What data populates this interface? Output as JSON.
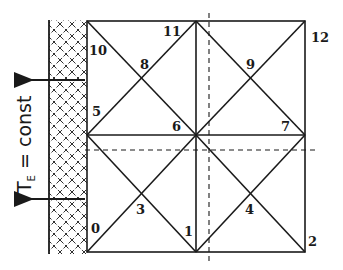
{
  "diagram": {
    "boundary_label": {
      "symbol": "T",
      "subscript": "E",
      "rest": " = const"
    },
    "colors": {
      "line": "#1a1a1a",
      "background": "#ffffff"
    },
    "nodes": [
      {
        "id": "0",
        "label": "0",
        "x": 87,
        "y": 252
      },
      {
        "id": "1",
        "label": "1",
        "x": 196,
        "y": 252
      },
      {
        "id": "2",
        "label": "2",
        "x": 305,
        "y": 252
      },
      {
        "id": "3",
        "label": "3",
        "x": 141,
        "y": 194
      },
      {
        "id": "4",
        "label": "4",
        "x": 250,
        "y": 194
      },
      {
        "id": "5",
        "label": "5",
        "x": 87,
        "y": 135
      },
      {
        "id": "6",
        "label": "6",
        "x": 196,
        "y": 135
      },
      {
        "id": "7",
        "label": "7",
        "x": 305,
        "y": 135
      },
      {
        "id": "8",
        "label": "8",
        "x": 141,
        "y": 78
      },
      {
        "id": "9",
        "label": "9",
        "x": 250,
        "y": 78
      },
      {
        "id": "10",
        "label": "10",
        "x": 87,
        "y": 21
      },
      {
        "id": "11",
        "label": "11",
        "x": 196,
        "y": 21
      },
      {
        "id": "12",
        "label": "12",
        "x": 305,
        "y": 21
      }
    ],
    "symmetry_lines": [
      "vertical-dashed",
      "horizontal-dashed"
    ],
    "heat_flux_arrows": 2
  }
}
